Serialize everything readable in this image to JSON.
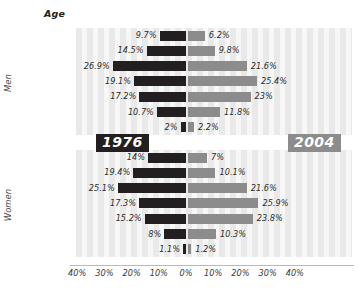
{
  "axis_title": "Age",
  "side_labels": {
    "men": "Men",
    "women": "Women"
  },
  "eras": {
    "left": "1976",
    "right": "2004"
  },
  "colors": {
    "left_bar": "#231f20",
    "right_bar": "#8c8c8c",
    "background_stripe": "#e9e9e9"
  },
  "x_ticks": [
    "40%",
    "30%",
    "20%",
    "10%",
    "0%",
    "10%",
    "20%",
    "30%",
    "40%"
  ],
  "chart_data": {
    "type": "bar",
    "title": "Age",
    "xlabel": "",
    "ylabel": "Age",
    "orientation": "horizontal-diverging",
    "xlim": [
      -40,
      40
    ],
    "grid": false,
    "legend": [
      "1976",
      "2004"
    ],
    "legend_position": "center-middle",
    "categories": [
      "15–19",
      "20–24",
      "25–34",
      "35–44",
      "45–54",
      "55–64",
      "65 +"
    ],
    "groups": [
      {
        "name": "Men",
        "series": [
          {
            "name": "1976",
            "side": "left",
            "values": [
              9.7,
              14.5,
              26.9,
              19.1,
              17.2,
              10.7,
              2.0
            ],
            "labels": [
              "9.7%",
              "14.5%",
              "26.9%",
              "19.1%",
              "17.2%",
              "10.7%",
              "2%"
            ]
          },
          {
            "name": "2004",
            "side": "right",
            "values": [
              6.2,
              9.8,
              21.6,
              25.4,
              23.0,
              11.8,
              2.2
            ],
            "labels": [
              "6.2%",
              "9.8%",
              "21.6%",
              "25.4%",
              "23%",
              "11.8%",
              "2.2%"
            ]
          }
        ]
      },
      {
        "name": "Women",
        "series": [
          {
            "name": "1976",
            "side": "left",
            "values": [
              14.0,
              19.4,
              25.1,
              17.3,
              15.2,
              8.0,
              1.1
            ],
            "labels": [
              "14%",
              "19.4%",
              "25.1%",
              "17.3%",
              "15.2%",
              "8%",
              "1.1%"
            ]
          },
          {
            "name": "2004",
            "side": "right",
            "values": [
              7.0,
              10.1,
              21.6,
              25.9,
              23.8,
              10.3,
              1.2
            ],
            "labels": [
              "7%",
              "10.1%",
              "21.6%",
              "25.9%",
              "23.8%",
              "10.3%",
              "1.2%"
            ]
          }
        ]
      }
    ]
  }
}
